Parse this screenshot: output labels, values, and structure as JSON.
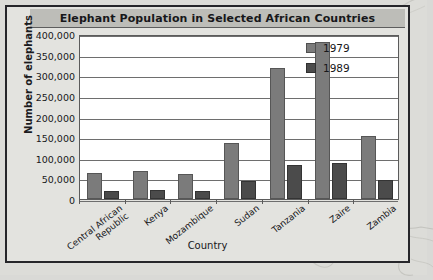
{
  "chart_data": {
    "type": "bar",
    "title": "Elephant Population in Selected African Countries",
    "xlabel": "Country",
    "ylabel": "Number of elephants",
    "categories": [
      "Central African Republic",
      "Kenya",
      "Mozambique",
      "Sudan",
      "Tanzania",
      "Zaire",
      "Zambia"
    ],
    "category_lines": [
      [
        "Central African",
        "Republic"
      ],
      [
        "Kenya"
      ],
      [
        "Mozambique"
      ],
      [
        "Sudan"
      ],
      [
        "Tanzania"
      ],
      [
        "Zaire"
      ],
      [
        "Zambia"
      ]
    ],
    "series": [
      {
        "name": "1979",
        "color": "#7b7b7b",
        "values": [
          63000,
          67000,
          60000,
          135000,
          318000,
          380000,
          152000
        ]
      },
      {
        "name": "1989",
        "color": "#4b4b4b",
        "values": [
          20000,
          21000,
          19000,
          43000,
          83000,
          88000,
          45000
        ]
      }
    ],
    "ylim": [
      0,
      400000
    ],
    "ytick_values": [
      0,
      50000,
      100000,
      150000,
      200000,
      250000,
      300000,
      350000,
      400000
    ],
    "ytick_labels": [
      "0",
      "50,000",
      "100,000",
      "150,000",
      "200,000",
      "250,000",
      "300,000",
      "350,000",
      "400,000"
    ],
    "grid": true,
    "legend_position": "top-right"
  },
  "legend": {
    "entries": [
      {
        "label": "1979",
        "color": "#7b7b7b"
      },
      {
        "label": "1989",
        "color": "#4b4b4b"
      }
    ]
  },
  "colors": {
    "series_1979": "#7b7b7b",
    "series_1989": "#4b4b4b",
    "frame": "#26262a",
    "title_banner": "#bdbdb8",
    "page_background": "#dcdcd8",
    "plot_background": "#ffffff",
    "gridline": "#6e6e6e"
  }
}
